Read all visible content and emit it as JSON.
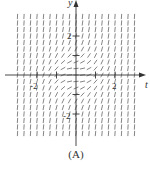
{
  "figure": {
    "caption": "(A)",
    "type": "slope-field",
    "x_axis_label": "t",
    "y_axis_label": "y",
    "x_tick_labels": [
      "-2",
      "2"
    ],
    "y_tick_labels": [
      "2",
      "-2"
    ],
    "x_ticks": [
      -2,
      -1,
      1,
      2
    ],
    "y_ticks": [
      -2,
      -1,
      1,
      2
    ],
    "grid_range": {
      "t": [
        -3,
        3
      ],
      "y": [
        -3,
        3
      ]
    },
    "grid_count": 19,
    "slope_function": "t^2 + y^2",
    "colors": {
      "axis": "#333333",
      "segment": "#666666",
      "label": "#333333"
    }
  }
}
